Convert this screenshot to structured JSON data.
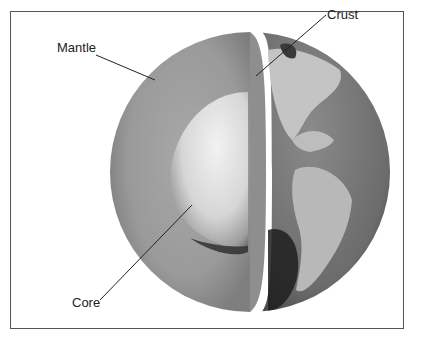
{
  "diagram": {
    "labels": {
      "mantle": "Mantle",
      "crust": "Crust",
      "core": "Core"
    },
    "colors": {
      "mantle": "#9a9a9a",
      "core_light": "#e8e8e8",
      "core_shadow": "#2a2a2a",
      "crust_ocean": "#6f6f6f",
      "land": "#c8c8c8",
      "frame": "#555555"
    }
  }
}
